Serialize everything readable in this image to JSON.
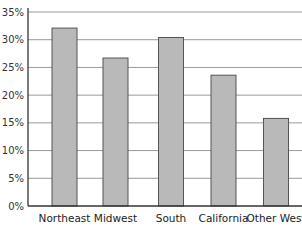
{
  "chart_data": {
    "type": "bar",
    "title": "",
    "xlabel": "",
    "ylabel": "",
    "categories": [
      "Northeast",
      "Midwest",
      "South",
      "California",
      "Other West"
    ],
    "values": [
      32.1,
      26.7,
      30.4,
      23.6,
      15.8
    ],
    "value_unit": "%",
    "ylim": [
      0,
      35
    ],
    "yticks": [
      0,
      5,
      10,
      15,
      20,
      25,
      30,
      35
    ],
    "ytick_labels": [
      "0%",
      "5%",
      "10%",
      "15%",
      "20%",
      "25%",
      "30%",
      "35%"
    ],
    "grid": true,
    "legend": null,
    "bar_color": "#b9b9b9",
    "bar_edge_color": "#555555"
  }
}
